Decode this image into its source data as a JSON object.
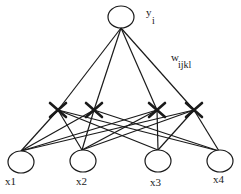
{
  "diagram": {
    "type": "higher-order neural network",
    "output_node": {
      "label": "y",
      "subscript": "i"
    },
    "weight_label": {
      "label": "w",
      "subscript": "ijkl"
    },
    "input_nodes": [
      {
        "label": "x1"
      },
      {
        "label": "x2"
      },
      {
        "label": "x3"
      },
      {
        "label": "x4"
      }
    ],
    "product_units_count": 4,
    "colors": {
      "stroke": "#1a1a1a",
      "background": "#ffffff"
    }
  }
}
